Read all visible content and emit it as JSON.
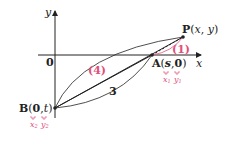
{
  "diagram": {
    "axes": {
      "x_label": "x",
      "y_label": "y",
      "origin_label": "0"
    },
    "points": {
      "P": {
        "name": "P",
        "open": "(",
        "c1": "x",
        "comma": ",",
        "c2": "y",
        "close": ")"
      },
      "A": {
        "name": "A",
        "open": "(",
        "c1": "s",
        "comma": ",",
        "c2": "0",
        "close": ")",
        "sub1": "x",
        "sub1_idx": "1",
        "sub2": "y",
        "sub2_idx": "1"
      },
      "B": {
        "name": "B",
        "open": "(",
        "c1": "0",
        "comma": ",",
        "c2": "t",
        "close": ")",
        "sub1": "x",
        "sub1_idx": "2",
        "sub2": "y",
        "sub2_idx": "2"
      }
    },
    "segment_labels": {
      "AP": "(1)",
      "BP": "(4)",
      "AB": "3"
    },
    "colors": {
      "ink": "#222222",
      "accent": "#e0507a"
    }
  }
}
